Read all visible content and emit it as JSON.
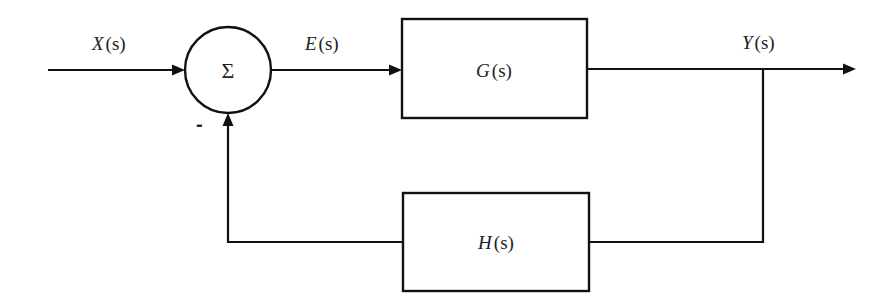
{
  "diagram": {
    "type": "negative feedback control loop block diagram",
    "signals": {
      "input": {
        "name": "X",
        "arg": "(s)"
      },
      "error": {
        "name": "E",
        "arg": "(s)"
      },
      "output": {
        "name": "Y",
        "arg": "(s)"
      }
    },
    "summing_junction": {
      "symbol": "Σ",
      "feedback_sign": "-"
    },
    "blocks": {
      "forward": {
        "name": "G",
        "arg": "(s)"
      },
      "feedback": {
        "name": "H",
        "arg": "(s)"
      }
    },
    "colors": {
      "stroke": "#111111",
      "text": "#222222",
      "background": "#ffffff"
    }
  }
}
